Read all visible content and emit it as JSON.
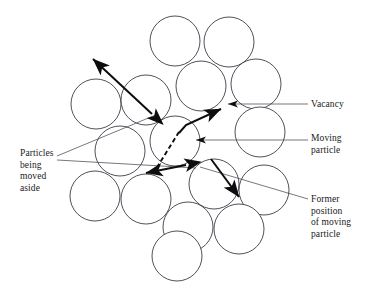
{
  "figure": {
    "domain_type": "diagram",
    "title_text": "",
    "background_color": "#ffffff",
    "circle_stroke_color": "#3c3c46",
    "arrow_color": "#0d0d0d",
    "leader_color": "#3c3c46",
    "text_color": "#1a1a1a"
  },
  "labels": {
    "vacancy": "Vacancy",
    "moving_particle": "Moving\nparticle",
    "former_position": "Former\nposition\nof moving\nparticle",
    "particles_moved_aside": "Particles\nbeing\nmoved\naside"
  },
  "particles": [
    {
      "id": "p1",
      "cx": 175,
      "cy": 41,
      "r": 25
    },
    {
      "id": "p2",
      "cx": 229,
      "cy": 42,
      "r": 25
    },
    {
      "id": "p3",
      "cx": 201,
      "cy": 86,
      "r": 25
    },
    {
      "id": "p4",
      "cx": 256,
      "cy": 84,
      "r": 25
    },
    {
      "id": "p5",
      "cx": 96,
      "cy": 104,
      "r": 25
    },
    {
      "id": "p6",
      "cx": 146,
      "cy": 100,
      "r": 25
    },
    {
      "id": "p7",
      "cx": 175,
      "cy": 141,
      "r": 25
    },
    {
      "id": "p8",
      "cx": 260,
      "cy": 132,
      "r": 25
    },
    {
      "id": "p9",
      "cx": 120,
      "cy": 151,
      "r": 25
    },
    {
      "id": "p10",
      "cx": 95,
      "cy": 196,
      "r": 25
    },
    {
      "id": "p11",
      "cx": 146,
      "cy": 199,
      "r": 25
    },
    {
      "id": "p12",
      "cx": 214,
      "cy": 184,
      "r": 25
    },
    {
      "id": "p13",
      "cx": 264,
      "cy": 190,
      "r": 25
    },
    {
      "id": "p14",
      "cx": 188,
      "cy": 227,
      "r": 25
    },
    {
      "id": "p15",
      "cx": 239,
      "cy": 229,
      "r": 25
    },
    {
      "id": "p16",
      "cx": 177,
      "cy": 256,
      "r": 25
    }
  ],
  "arrows": {
    "upper_left_double": {
      "name": "particles-aside-arrow-upper",
      "from_x": 155,
      "from_y": 112,
      "to_x": 91,
      "to_y": 57,
      "double_headed": true,
      "style": "solid"
    },
    "moving_particle_path": {
      "name": "moving-particle-arrow",
      "bend_x": 181,
      "bend_y": 130,
      "tip_x": 224,
      "tip_y": 107,
      "style": "solid"
    },
    "former_position_dashed": {
      "name": "former-position-dashed-path",
      "from_x": 181,
      "from_y": 130,
      "to_x": 155,
      "to_y": 170,
      "style": "dashed"
    },
    "lower_left_double": {
      "name": "particles-aside-arrow-lower",
      "from_x": 185,
      "from_y": 166,
      "to_x": 143,
      "to_y": 174,
      "double_headed": true,
      "style": "solid"
    },
    "former_position_arrow": {
      "name": "former-position-arrow",
      "from_x": 212,
      "from_y": 160,
      "to_x": 240,
      "to_y": 198,
      "style": "solid"
    }
  },
  "leader_lines": {
    "vacancy": {
      "x1": 308,
      "y1": 104,
      "x2": 225,
      "y2": 104,
      "arrowhead": true
    },
    "moving_particle": {
      "x1": 308,
      "y1": 140,
      "x2": 193,
      "y2": 140,
      "arrowhead": true
    },
    "former_position": {
      "x1": 308,
      "y1": 199,
      "x2": 196,
      "y2": 166,
      "arrowhead": true
    },
    "particles_aside_upper": {
      "x1": 57,
      "y1": 156,
      "x2": 158,
      "y2": 114,
      "arrowhead": false
    },
    "particles_aside_lower": {
      "x1": 57,
      "y1": 163,
      "x2": 186,
      "y2": 167,
      "arrowhead": false
    }
  }
}
